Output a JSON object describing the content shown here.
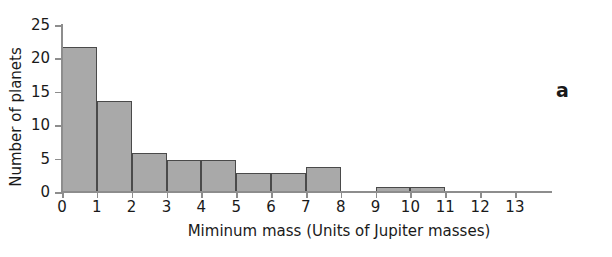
{
  "panel": {
    "label": "a"
  },
  "chart_data": {
    "type": "bar",
    "title": "",
    "subtitle": "",
    "xlabel": "Miminum mass (Units of Jupiter masses)",
    "ylabel": "Number of planets",
    "xlim": [
      0,
      13
    ],
    "ylim": [
      0,
      25
    ],
    "grid": false,
    "legend": null,
    "bar_style": "histogram",
    "bar_fill": "#a9a9a9",
    "bar_edge": "#4a4a4a",
    "axis_color": "#8d8d8d",
    "bin_width": 1,
    "xticks": [
      0,
      1,
      2,
      3,
      4,
      5,
      6,
      7,
      8,
      9,
      10,
      11,
      12,
      13
    ],
    "xticklabels": [
      "0",
      "1",
      "2",
      "3",
      "4",
      "5",
      "6",
      "7",
      "8",
      "9",
      "10",
      "11",
      "12",
      "13"
    ],
    "yticks": [
      0,
      5,
      10,
      15,
      20,
      25
    ],
    "yticklabels": [
      "0",
      "5",
      "10",
      "15",
      "20",
      "25"
    ],
    "bins": [
      {
        "x0": 0,
        "x1": 1,
        "value": 21.7
      },
      {
        "x0": 1,
        "x1": 2,
        "value": 13.6
      },
      {
        "x0": 2,
        "x1": 3,
        "value": 5.8
      },
      {
        "x0": 3,
        "x1": 4,
        "value": 4.8
      },
      {
        "x0": 4,
        "x1": 5,
        "value": 4.8
      },
      {
        "x0": 5,
        "x1": 6,
        "value": 2.8
      },
      {
        "x0": 6,
        "x1": 7,
        "value": 2.8
      },
      {
        "x0": 7,
        "x1": 8,
        "value": 3.7
      },
      {
        "x0": 8,
        "x1": 9,
        "value": 0
      },
      {
        "x0": 9,
        "x1": 10,
        "value": 0.8
      },
      {
        "x0": 10,
        "x1": 11,
        "value": 0.8
      },
      {
        "x0": 11,
        "x1": 12,
        "value": 0
      },
      {
        "x0": 12,
        "x1": 13,
        "value": 0
      }
    ],
    "categories": [
      "0-1",
      "1-2",
      "2-3",
      "3-4",
      "4-5",
      "5-6",
      "6-7",
      "7-8",
      "8-9",
      "9-10",
      "10-11",
      "11-12",
      "12-13"
    ],
    "values": [
      21.7,
      13.6,
      5.8,
      4.8,
      4.8,
      2.8,
      2.8,
      3.7,
      0,
      0.8,
      0.8,
      0,
      0
    ]
  }
}
